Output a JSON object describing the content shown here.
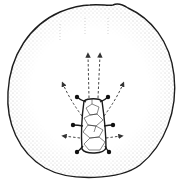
{
  "figure": {
    "colors": {
      "background": "#ffffff",
      "outline": "#1a1a1a",
      "stipple": "#8a8a8a",
      "arrow": "#333333"
    },
    "arrows": [
      {
        "direction": "up",
        "from": [
          88,
          98
        ],
        "to": [
          88,
          52
        ]
      },
      {
        "direction": "up",
        "from": [
          100,
          98
        ],
        "to": [
          100,
          52
        ]
      },
      {
        "direction": "up-left",
        "from": [
          82,
          116
        ],
        "to": [
          62,
          82
        ]
      },
      {
        "direction": "up-right",
        "from": [
          104,
          116
        ],
        "to": [
          124,
          82
        ]
      },
      {
        "direction": "left",
        "from": [
          80,
          138
        ],
        "to": [
          62,
          135
        ]
      },
      {
        "direction": "right",
        "from": [
          106,
          138
        ],
        "to": [
          122,
          135
        ]
      }
    ],
    "knobs": [
      {
        "side": "left",
        "x": 77,
        "y": 97
      },
      {
        "side": "right",
        "x": 108,
        "y": 97
      },
      {
        "side": "left",
        "x": 73,
        "y": 125
      },
      {
        "side": "right",
        "x": 113,
        "y": 125
      },
      {
        "side": "left",
        "x": 77,
        "y": 152
      },
      {
        "side": "right",
        "x": 109,
        "y": 152
      }
    ]
  }
}
